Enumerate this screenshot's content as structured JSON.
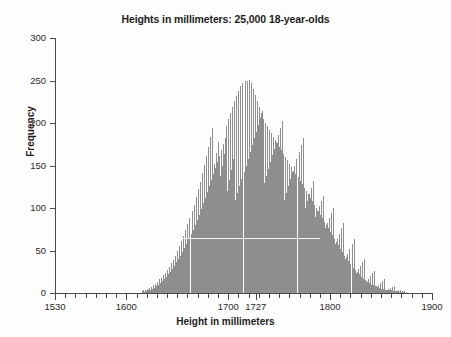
{
  "chart_data": {
    "type": "bar",
    "title": "Heights in millimeters: 25,000 18-year-olds",
    "xlabel": "Height in millimeters",
    "ylabel": "Frequency",
    "xlim": [
      1530,
      1900
    ],
    "ylim": [
      0,
      300
    ],
    "xticks": [
      1530,
      1600,
      1700,
      1727,
      1800,
      1900
    ],
    "xtick_labels": [
      "1530",
      "1600",
      "1700",
      "1727",
      "1800",
      "1900"
    ],
    "xminor_step": 10,
    "yticks": [
      0,
      50,
      100,
      150,
      200,
      250,
      300
    ],
    "ytick_labels": [
      "0",
      "50",
      "100",
      "150",
      "200",
      "250",
      "300"
    ],
    "grid": false,
    "legend": null,
    "bin_width": 1,
    "bar_color": "#8e8e8e",
    "annotations": [
      {
        "name": "reference-line",
        "type": "hline",
        "y": 65,
        "x_start": 1653,
        "x_end": 1790,
        "color": "#f2f2ef"
      }
    ],
    "x_start": 1615,
    "categories": [
      1615,
      1616,
      1617,
      1618,
      1619,
      1620,
      1621,
      1622,
      1623,
      1624,
      1625,
      1626,
      1627,
      1628,
      1629,
      1630,
      1631,
      1632,
      1633,
      1634,
      1635,
      1636,
      1637,
      1638,
      1639,
      1640,
      1641,
      1642,
      1643,
      1644,
      1645,
      1646,
      1647,
      1648,
      1649,
      1650,
      1651,
      1652,
      1653,
      1654,
      1655,
      1656,
      1657,
      1658,
      1659,
      1660,
      1661,
      1662,
      1663,
      1664,
      1665,
      1666,
      1667,
      1668,
      1669,
      1670,
      1671,
      1672,
      1673,
      1674,
      1675,
      1676,
      1677,
      1678,
      1679,
      1680,
      1681,
      1682,
      1683,
      1684,
      1685,
      1686,
      1687,
      1688,
      1689,
      1690,
      1691,
      1692,
      1693,
      1694,
      1695,
      1696,
      1697,
      1698,
      1699,
      1700,
      1701,
      1702,
      1703,
      1704,
      1705,
      1706,
      1707,
      1708,
      1709,
      1710,
      1711,
      1712,
      1713,
      1714,
      1715,
      1716,
      1717,
      1718,
      1719,
      1720,
      1721,
      1722,
      1723,
      1724,
      1725,
      1726,
      1727,
      1728,
      1729,
      1730,
      1731,
      1732,
      1733,
      1734,
      1735,
      1736,
      1737,
      1738,
      1739,
      1740,
      1741,
      1742,
      1743,
      1744,
      1745,
      1746,
      1747,
      1748,
      1749,
      1750,
      1751,
      1752,
      1753,
      1754,
      1755,
      1756,
      1757,
      1758,
      1759,
      1760,
      1761,
      1762,
      1763,
      1764,
      1765,
      1766,
      1767,
      1768,
      1769,
      1770,
      1771,
      1772,
      1773,
      1774,
      1775,
      1776,
      1777,
      1778,
      1779,
      1780,
      1781,
      1782,
      1783,
      1784,
      1785,
      1786,
      1787,
      1788,
      1789,
      1790,
      1791,
      1792,
      1793,
      1794,
      1795,
      1796,
      1797,
      1798,
      1799,
      1800,
      1801,
      1802,
      1803,
      1804,
      1805,
      1806,
      1807,
      1808,
      1809,
      1810,
      1811,
      1812,
      1813,
      1814,
      1815,
      1816,
      1817,
      1818,
      1819,
      1820,
      1821,
      1822,
      1823,
      1824,
      1825,
      1826,
      1827,
      1828,
      1829,
      1830,
      1831,
      1832,
      1833,
      1834,
      1835,
      1836,
      1837,
      1838,
      1839,
      1840,
      1841,
      1842,
      1843,
      1844,
      1845,
      1846,
      1847,
      1848,
      1849,
      1850,
      1851,
      1852,
      1853,
      1854,
      1855,
      1856,
      1857,
      1858,
      1859,
      1860,
      1861,
      1862,
      1863,
      1864,
      1865,
      1866,
      1867,
      1868,
      1869,
      1870,
      1871,
      1872,
      1873,
      1874
    ],
    "values": [
      2,
      3,
      1,
      4,
      2,
      5,
      3,
      6,
      4,
      7,
      5,
      9,
      6,
      11,
      8,
      13,
      10,
      16,
      12,
      18,
      14,
      21,
      17,
      24,
      19,
      27,
      22,
      31,
      25,
      35,
      28,
      39,
      32,
      44,
      36,
      49,
      40,
      55,
      44,
      61,
      48,
      67,
      53,
      74,
      58,
      81,
      63,
      88,
      69,
      96,
      74,
      104,
      80,
      113,
      86,
      122,
      92,
      131,
      99,
      141,
      106,
      151,
      112,
      161,
      119,
      172,
      126,
      183,
      133,
      194,
      140,
      152,
      147,
      165,
      154,
      178,
      161,
      138,
      168,
      150,
      175,
      163,
      182,
      196,
      120,
      205,
      133,
      212,
      145,
      219,
      158,
      226,
      110,
      232,
      118,
      238,
      126,
      243,
      134,
      247,
      142,
      249,
      150,
      250,
      158,
      251,
      166,
      247,
      174,
      240,
      182,
      233,
      190,
      226,
      198,
      219,
      206,
      212,
      214,
      205,
      130,
      200,
      138,
      196,
      146,
      192,
      154,
      188,
      162,
      184,
      170,
      180,
      178,
      176,
      186,
      172,
      194,
      168,
      202,
      164,
      110,
      160,
      118,
      156,
      126,
      152,
      134,
      148,
      142,
      144,
      150,
      140,
      158,
      136,
      166,
      132,
      174,
      128,
      182,
      124,
      100,
      120,
      108,
      116,
      116,
      112,
      124,
      108,
      132,
      104,
      90,
      100,
      96,
      96,
      102,
      92,
      108,
      88,
      114,
      84,
      76,
      80,
      82,
      76,
      88,
      72,
      94,
      68,
      100,
      64,
      58,
      60,
      64,
      56,
      70,
      52,
      76,
      48,
      82,
      44,
      40,
      42,
      46,
      38,
      52,
      34,
      58,
      30,
      64,
      27,
      24,
      25,
      28,
      22,
      32,
      19,
      36,
      17,
      40,
      15,
      14,
      13,
      17,
      12,
      20,
      10,
      23,
      9,
      26,
      8,
      8,
      7,
      10,
      6,
      12,
      5,
      14,
      5,
      16,
      4,
      4,
      4,
      5,
      3,
      6,
      3,
      7,
      2,
      8,
      2,
      2,
      2,
      3,
      1,
      3,
      1,
      2,
      1,
      2,
      1
    ]
  }
}
